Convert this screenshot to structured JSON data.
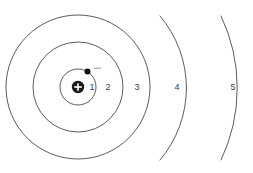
{
  "diagram": {
    "kind": "bohr-atomic-model",
    "background_color": "#ffffff",
    "line_color": "#4a4a4a",
    "label_color": "#3d3d3d",
    "center": {
      "x": 78,
      "y": 87
    },
    "nucleus": {
      "symbol": "+",
      "radius": 6.2,
      "fill_color": "#1a1a1a",
      "symbol_color": "#ffffff",
      "x": 78,
      "y": 87
    },
    "electron": {
      "symbol": "-",
      "radius": 3.0,
      "fill_color": "#0d0d0d",
      "x": 87.5,
      "y": 71.5,
      "charge_mark": {
        "color": "#9a9a9a",
        "x1": 94,
        "y1": 68.5,
        "x2": 101,
        "y2": 68.0
      }
    },
    "shells": [
      {
        "number": "1",
        "radius": 18,
        "complete": true,
        "label_x": 92,
        "label_y": 88
      },
      {
        "number": "2",
        "radius": 45,
        "complete": true,
        "label_x": 108,
        "label_y": 88
      },
      {
        "number": "3",
        "radius": 72,
        "complete": true,
        "label_x": 137,
        "label_y": 88
      },
      {
        "number": "4",
        "radius": 111,
        "complete": false,
        "arc_start_x": 160,
        "arc_start_y": 16,
        "arc_end_x": 160,
        "arc_end_y": 160,
        "label_x": 177,
        "label_y": 88
      },
      {
        "number": "5",
        "radius": 167,
        "complete": false,
        "arc_start_x": 221,
        "arc_start_y": 16,
        "arc_end_x": 221,
        "arc_end_y": 160,
        "label_x": 233,
        "label_y": 88
      }
    ]
  }
}
